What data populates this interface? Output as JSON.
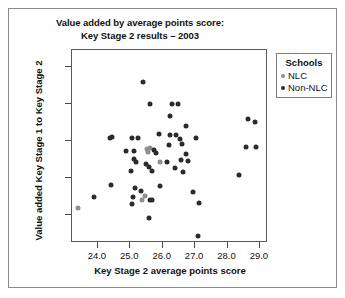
{
  "chart_data": {
    "type": "scatter",
    "title": "Value added by average points score: Key Stage 2 results – 2003",
    "title_lines": [
      "Value added by average points score:",
      "Key Stage 2 results – 2003"
    ],
    "xlabel": "Key Stage 2 average points score",
    "ylabel": "Value added Key Stage 1 to Key Stage 2",
    "xlim": [
      23.2,
      29.25
    ],
    "ylim": [
      98.25,
      103.45
    ],
    "xticks": [
      24.0,
      25.0,
      26.0,
      27.0,
      28.0,
      29.0
    ],
    "xtick_labels": [
      "24.0",
      "25.0",
      "26.0",
      "27.0",
      "28.0",
      "29.0"
    ],
    "yticks": [
      99.0,
      100.0,
      101.0,
      102.0,
      103.0
    ],
    "ytick_labels": [
      "99.0",
      "100.0",
      "101.0",
      "102.0",
      "103.0"
    ],
    "grid": false,
    "legend_position": "right-outside",
    "legend_title": "Schools",
    "series": [
      {
        "name": "NLC",
        "color": "#8d8d8d",
        "points": [
          [
            23.4,
            99.18
          ],
          [
            25.52,
            100.78
          ],
          [
            25.55,
            100.7
          ],
          [
            25.92,
            100.42
          ],
          [
            25.45,
            99.52
          ],
          [
            25.35,
            99.4
          ],
          [
            25.6,
            100.82
          ]
        ]
      },
      {
        "name": "Non-NLC",
        "color": "#2b2b2b",
        "points": [
          [
            25.38,
            102.58
          ],
          [
            25.62,
            102.0
          ],
          [
            26.3,
            102.0
          ],
          [
            26.48,
            102.0
          ],
          [
            26.22,
            101.68
          ],
          [
            26.72,
            101.4
          ],
          [
            28.62,
            101.58
          ],
          [
            28.85,
            101.5
          ],
          [
            24.38,
            101.08
          ],
          [
            25.05,
            101.08
          ],
          [
            25.25,
            101.08
          ],
          [
            25.88,
            101.18
          ],
          [
            26.22,
            101.15
          ],
          [
            26.4,
            101.15
          ],
          [
            26.52,
            101.05
          ],
          [
            27.02,
            101.08
          ],
          [
            24.42,
            101.1
          ],
          [
            26.6,
            100.92
          ],
          [
            28.58,
            100.85
          ],
          [
            28.88,
            100.85
          ],
          [
            26.18,
            100.88
          ],
          [
            24.88,
            100.72
          ],
          [
            25.12,
            100.72
          ],
          [
            25.72,
            100.75
          ],
          [
            25.78,
            100.68
          ],
          [
            26.72,
            100.65
          ],
          [
            25.1,
            100.52
          ],
          [
            26.55,
            100.48
          ],
          [
            26.78,
            100.45
          ],
          [
            25.18,
            100.42
          ],
          [
            25.48,
            100.38
          ],
          [
            26.12,
            100.42
          ],
          [
            25.58,
            100.3
          ],
          [
            26.38,
            100.28
          ],
          [
            25.02,
            100.18
          ],
          [
            25.68,
            100.18
          ],
          [
            26.62,
            100.15
          ],
          [
            28.35,
            100.08
          ],
          [
            24.4,
            99.82
          ],
          [
            25.15,
            99.72
          ],
          [
            25.32,
            99.65
          ],
          [
            25.92,
            99.78
          ],
          [
            26.92,
            99.62
          ],
          [
            23.88,
            99.48
          ],
          [
            25.08,
            99.48
          ],
          [
            25.62,
            99.4
          ],
          [
            25.68,
            99.42
          ],
          [
            25.05,
            99.3
          ],
          [
            27.12,
            99.32
          ],
          [
            25.58,
            98.92
          ],
          [
            27.08,
            98.45
          ]
        ]
      }
    ]
  }
}
